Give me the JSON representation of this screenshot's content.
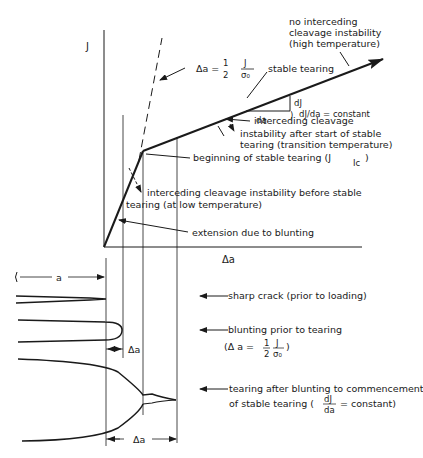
{
  "diagram": {
    "axes": {
      "y_label": "J",
      "x_label": "Δa"
    },
    "curve_annotations": {
      "no_cleavage": [
        "no interceding",
        "cleavage instability",
        "(high temperature)"
      ],
      "blunting_line_eq": {
        "lhs": "Δa =",
        "num1": "1",
        "den1": "2",
        "num2": "J",
        "den2": "σ₀"
      },
      "stable_tearing": "stable tearing",
      "slope_dJ": "dJ",
      "slope_da": "da",
      "slope_const": "dJ/da = constant",
      "cleavage_transition": [
        "interceding cleavage",
        "instability after start of stable",
        "tearing (transition temperature)"
      ],
      "beginning_tearing": "beginning of stable tearing (J",
      "beginning_tearing_sub": "Ic",
      "beginning_tearing_close": ")",
      "cleavage_low": [
        "interceding cleavage instability before stable",
        "tearing (at low temperature)"
      ],
      "blunting_extension": "extension due to blunting"
    },
    "crack_annotations": {
      "crack_length": "a",
      "sharp_crack": "sharp crack (prior to loading)",
      "blunting": "blunting prior to tearing",
      "blunting_eq": {
        "open": "(Δ a =",
        "num1": "1",
        "den1": "2",
        "num2": "J",
        "den2": "σ₀",
        "close": ")"
      },
      "delta_a_small": "Δa",
      "tearing": "tearing after blunting to commencement",
      "tearing_eq": {
        "prefix": "of stable tearing (",
        "num": "dJ",
        "den": "da",
        "suffix": "= constant)"
      },
      "delta_a_large": "Δa"
    },
    "colors": {
      "ink": "#1a1a1a",
      "background": "#ffffff"
    }
  }
}
